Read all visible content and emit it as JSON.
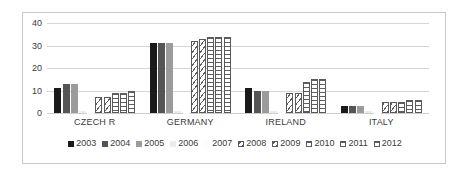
{
  "chart_data": {
    "type": "bar",
    "title": "",
    "subtitle": "",
    "xlabel": "",
    "ylabel": "",
    "ylim": [
      0,
      40
    ],
    "yticks": [
      0,
      10,
      20,
      30,
      40
    ],
    "grid": true,
    "legend_position": "bottom",
    "categories": [
      "CZECH R",
      "GERMANY",
      "IRELAND",
      "ITALY"
    ],
    "series": [
      {
        "name": "2003",
        "style": "solid-black",
        "color": "#1a1a1a",
        "values": [
          11,
          31,
          11,
          3
        ]
      },
      {
        "name": "2004",
        "style": "solid-dark-gray",
        "color": "#555555",
        "values": [
          13,
          31,
          10,
          3
        ]
      },
      {
        "name": "2005",
        "style": "solid-mid-gray",
        "color": "#9b9b9b",
        "values": [
          13,
          31,
          10,
          3
        ]
      },
      {
        "name": "2006",
        "style": "solid-light-gray",
        "color": "#ececec",
        "values": [
          1,
          1,
          1,
          1
        ]
      },
      {
        "name": "2007",
        "style": "solid-near-white",
        "color": "#fcfcfc",
        "values": [
          0,
          0,
          0,
          0
        ]
      },
      {
        "name": "2008",
        "style": "diagonal-hatch",
        "color": "#5f5f5f",
        "values": [
          7,
          32,
          9,
          5
        ]
      },
      {
        "name": "2009",
        "style": "diagonal-hatch",
        "color": "#5f5f5f",
        "values": [
          7,
          33,
          9,
          5
        ]
      },
      {
        "name": "2010",
        "style": "horizontal-hatch",
        "color": "#5f5f5f",
        "values": [
          9,
          34,
          14,
          5
        ]
      },
      {
        "name": "2011",
        "style": "horizontal-hatch",
        "color": "#5f5f5f",
        "values": [
          9,
          34,
          15,
          6
        ]
      },
      {
        "name": "2012",
        "style": "horizontal-hatch",
        "color": "#5f5f5f",
        "values": [
          10,
          34,
          15,
          6
        ]
      }
    ]
  },
  "axis": {
    "ticks": [
      "40",
      "30",
      "20",
      "10",
      "0"
    ]
  }
}
